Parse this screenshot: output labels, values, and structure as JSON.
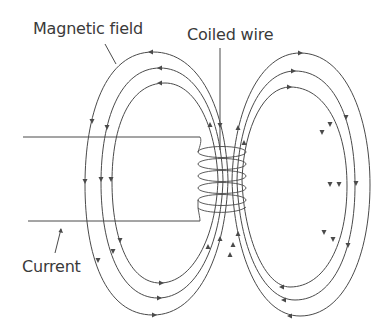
{
  "diagram": {
    "type": "electromagnet-field-lines",
    "labels": {
      "magnetic_field": "Magnetic field",
      "coiled_wire": "Coiled wire",
      "current": "Current"
    },
    "colors": {
      "line": "#4a4a4a",
      "text": "#3a3a3a",
      "background": "#ffffff"
    },
    "field_loops_per_side": 3,
    "coil_turns": 5
  }
}
